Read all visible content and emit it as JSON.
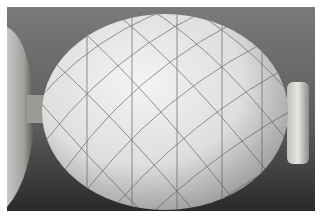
{
  "image": {
    "alt": "Egg with hand-drawn spiral grid lines mounted between two supports",
    "subject": "egg",
    "background_color": "#6e6e6e",
    "egg_color": "#e8e8e6",
    "line_color": "#555555"
  }
}
